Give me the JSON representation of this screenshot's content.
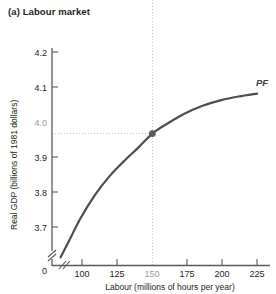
{
  "panel": {
    "title": "(a) Labour market"
  },
  "chart_data": {
    "type": "line",
    "title": "(a) Labour market",
    "xlabel": "Labour (millions of hours per year)",
    "ylabel": "Real GDP (billions of 1981 dollars)",
    "xlim": [
      80,
      232
    ],
    "ylim": [
      3.63,
      4.24
    ],
    "grid": false,
    "legend_position": "none",
    "axis_break_x": true,
    "axis_break_y": true,
    "origin_label": "0",
    "xticks": [
      100,
      125,
      150,
      175,
      200,
      225
    ],
    "xtick_labels": [
      "100",
      "125",
      "150",
      "175",
      "200",
      "225"
    ],
    "highlighted_xtick": "150",
    "yticks": [
      3.7,
      3.8,
      3.9,
      4.0,
      4.1,
      4.2
    ],
    "ytick_labels": [
      "3.7",
      "3.8",
      "3.9",
      "4.0",
      "4.1",
      "4.2"
    ],
    "highlighted_ytick": "4.0",
    "series": [
      {
        "name": "PF",
        "label": "PF",
        "color": "#4d4d4d",
        "x": [
          86,
          92,
          100,
          110,
          120,
          130,
          140,
          150,
          160,
          172,
          185,
          198,
          210,
          223
        ],
        "y": [
          3.653,
          3.7,
          3.763,
          3.828,
          3.88,
          3.922,
          3.96,
          4.0,
          4.027,
          4.055,
          4.078,
          4.094,
          4.104,
          4.112
        ]
      }
    ],
    "annotations": [
      {
        "name": "full-employment-point",
        "x": 150,
        "y": 4.0,
        "marker": "filled-circle",
        "color": "#5a5a5a",
        "guide_x": true,
        "guide_y": true
      }
    ]
  },
  "labels": {
    "curve_pf": "PF",
    "x_axis_title": "Labour (millions of hours per year)",
    "y_axis_title": "Real GDP (billions of 1981 dollars)",
    "zero": "0",
    "y_4_2": "4.2",
    "y_4_1": "4.1",
    "y_4_0": "4.0",
    "y_3_9": "3.9",
    "y_3_8": "3.8",
    "y_3_7": "3.7",
    "x_100": "100",
    "x_125": "125",
    "x_150": "150",
    "x_175": "175",
    "x_200": "200",
    "x_225": "225"
  }
}
